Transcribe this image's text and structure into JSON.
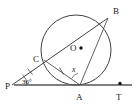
{
  "figure": {
    "background_color": "#ffffff",
    "stroke_color": "#2b2b2b",
    "baseline_color": "#55565a"
  },
  "points": [
    {
      "id": "P",
      "label": "P",
      "x": 12,
      "y": 85,
      "label_x": 5,
      "label_y": 89,
      "marker": false
    },
    {
      "id": "C",
      "label": "C",
      "x": 44,
      "y": 60,
      "label_x": 34,
      "label_y": 61,
      "marker": false
    },
    {
      "id": "B",
      "label": "B",
      "x": 108,
      "y": 18,
      "label_x": 113,
      "label_y": 13,
      "marker": false
    },
    {
      "id": "O",
      "label": "O",
      "x": 81,
      "y": 48,
      "label_x": 71,
      "label_y": 51,
      "marker": true
    },
    {
      "id": "A",
      "label": "A",
      "x": 80,
      "y": 85,
      "label_x": 76,
      "label_y": 100,
      "marker": false
    },
    {
      "id": "T",
      "label": "T",
      "x": 120,
      "y": 85,
      "label_x": 116,
      "label_y": 100,
      "marker": true
    }
  ],
  "circle": {
    "center_x": 76,
    "center_y": 50,
    "radius": 35
  },
  "segments": [
    {
      "name": "secant-PB",
      "from": "P",
      "to": "B"
    },
    {
      "name": "chord-CA",
      "from": "C",
      "to": "A"
    },
    {
      "name": "chord-AB",
      "from": "A",
      "to": "B"
    },
    {
      "name": "tangent-PT",
      "from": "P",
      "to": "T"
    }
  ],
  "angles": [
    {
      "name": "angle-at-P",
      "label": "36°",
      "vertex": "P",
      "label_x": 22,
      "label_y": 84
    },
    {
      "name": "angle-at-A",
      "label": "x",
      "vertex": "A",
      "label_x": 73,
      "label_y": 71
    }
  ],
  "tick_marks": [
    {
      "name": "tick-on-PC",
      "segment": "secant-PB",
      "count": 1
    },
    {
      "name": "tick-on-CA",
      "segment": "chord-CA",
      "count": 1
    }
  ]
}
